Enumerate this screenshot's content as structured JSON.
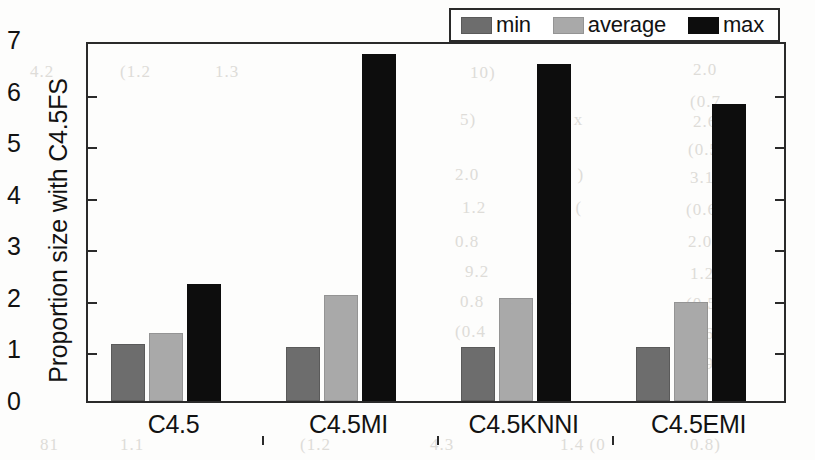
{
  "chart_data": {
    "type": "bar",
    "title": "",
    "subtitle": "",
    "xlabel": "",
    "ylabel": "Proportion size with C4.5FS",
    "categories": [
      "C4.5",
      "C4.5MI",
      "C4.5KNNI",
      "C4.5EMI"
    ],
    "series": [
      {
        "name": "min",
        "color": "#6d6d6d",
        "values": [
          1.1,
          1.05,
          1.04,
          1.05
        ]
      },
      {
        "name": "average",
        "color": "#a9a9a9",
        "values": [
          1.32,
          2.06,
          1.99,
          1.92
        ]
      },
      {
        "name": "max",
        "color": "#0d0d0d",
        "values": [
          2.26,
          6.72,
          6.53,
          5.75
        ]
      }
    ],
    "ylim": [
      0,
      7
    ],
    "ytick_labels": [
      "0",
      "1",
      "2",
      "3",
      "4",
      "5",
      "6",
      "7"
    ],
    "ytick_values": [
      0,
      1,
      2,
      3,
      4,
      5,
      6,
      7
    ],
    "grid": false,
    "legend_position": "top-right",
    "legend_entries": [
      "min",
      "average",
      "max"
    ]
  },
  "legend": {
    "entries": [
      {
        "label": "min",
        "swatch": "min"
      },
      {
        "label": "average",
        "swatch": "average"
      },
      {
        "label": "max",
        "swatch": "max"
      }
    ]
  },
  "background_artifacts": [
    {
      "text": "10)",
      "x": 470,
      "y": 63
    },
    {
      "text": "2.0",
      "x": 693,
      "y": 60
    },
    {
      "text": "(0.7",
      "x": 690,
      "y": 92
    },
    {
      "text": "5)",
      "x": 460,
      "y": 110
    },
    {
      "text": "101 x",
      "x": 540,
      "y": 110
    },
    {
      "text": "2.6",
      "x": 693,
      "y": 112
    },
    {
      "text": "(0.5",
      "x": 688,
      "y": 140
    },
    {
      "text": "2.0",
      "x": 455,
      "y": 165
    },
    {
      "text": "3.0 )",
      "x": 548,
      "y": 165
    },
    {
      "text": "3.1",
      "x": 690,
      "y": 168
    },
    {
      "text": "1.2",
      "x": 462,
      "y": 198
    },
    {
      "text": "1.3 (",
      "x": 546,
      "y": 198
    },
    {
      "text": "(0.6",
      "x": 686,
      "y": 200
    },
    {
      "text": "0.8",
      "x": 455,
      "y": 232
    },
    {
      "text": "2.0",
      "x": 688,
      "y": 232
    },
    {
      "text": "9.2",
      "x": 465,
      "y": 262
    },
    {
      "text": "1.2",
      "x": 690,
      "y": 264
    },
    {
      "text": "0.8",
      "x": 460,
      "y": 292
    },
    {
      "text": "6.4",
      "x": 548,
      "y": 292
    },
    {
      "text": "(0.5",
      "x": 686,
      "y": 294
    },
    {
      "text": "(0.4",
      "x": 455,
      "y": 322
    },
    {
      "text": "0.6",
      "x": 690,
      "y": 324
    },
    {
      "text": "4.1",
      "x": 468,
      "y": 352
    },
    {
      "text": "0.9",
      "x": 690,
      "y": 354
    },
    {
      "text": "(1.2",
      "x": 300,
      "y": 435
    },
    {
      "text": "4.3",
      "x": 430,
      "y": 435
    },
    {
      "text": "1.4 (0",
      "x": 560,
      "y": 435
    },
    {
      "text": "0.8)",
      "x": 690,
      "y": 435
    },
    {
      "text": "4.2",
      "x": 30,
      "y": 62
    },
    {
      "text": "(1.2",
      "x": 120,
      "y": 62
    },
    {
      "text": "1.3",
      "x": 215,
      "y": 62
    },
    {
      "text": "81",
      "x": 40,
      "y": 435
    },
    {
      "text": "1.1",
      "x": 120,
      "y": 435
    }
  ]
}
